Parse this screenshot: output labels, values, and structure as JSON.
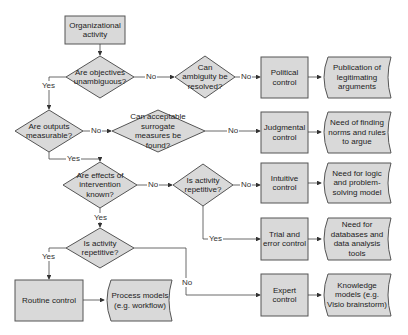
{
  "colors": {
    "fill": "#d9d9d9",
    "stroke": "#555555",
    "line": "#444444",
    "text": "#222222"
  },
  "nodes": {
    "start": "Organizational activity",
    "q_objectives": "Are objectives unambiguous?",
    "q_ambiguity": "Can ambiguity be resolved?",
    "political": "Political control",
    "political_doc": "Publication of legitimating arguments",
    "q_outputs": "Are outputs measurable?",
    "q_surrogate": "Can acceptable surrogate measures be found?",
    "judgmental": "Judgmental control",
    "judgmental_doc": "Need of finding norms and rules to argue",
    "q_effects": "Are effects of intervention known?",
    "q_repetitive_1": "Is activity repetitive?",
    "intuitive": "Intuitive control",
    "intuitive_doc": "Need for logic and problem-solving model",
    "q_repetitive_2": "Is activity repetitive?",
    "trial": "Trial and error control",
    "trial_doc": "Need for databases and data analysis tools",
    "routine": "Routine control",
    "routine_doc": "Process models (e.g. workflow)",
    "expert": "Expert control",
    "expert_doc": "Knowledge models (e.g. Visio brainstorm)"
  },
  "edge_labels": {
    "yes": "Yes",
    "no": "No"
  }
}
